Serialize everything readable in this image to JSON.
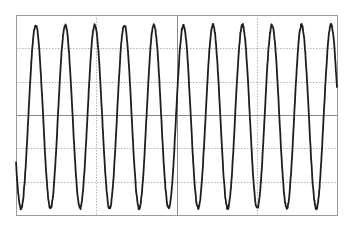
{
  "chart_data": {
    "type": "line",
    "title": "",
    "xlabel": "",
    "ylabel": "",
    "grid": true,
    "legend": null,
    "x_divisions": 4,
    "y_divisions": 6,
    "xlim": [
      0,
      4
    ],
    "ylim": [
      -3,
      3
    ],
    "series": [
      {
        "name": "waveform",
        "shape": "sine",
        "amplitude_div": 2.75,
        "offset_div": -0.05,
        "period_div": 0.368,
        "first_trough_x_div": 0.062,
        "cycles_visible": 10.9,
        "noise": true,
        "color": "#1e1e1e",
        "peaks_x_px": [
          36,
          65,
          95,
          124,
          154,
          185,
          214,
          244,
          273,
          303,
          331
        ],
        "troughs_x_px": [
          21,
          50,
          79,
          109,
          139,
          169,
          199,
          228,
          257,
          286,
          317
        ]
      }
    ]
  },
  "style": {
    "background": "#ffffff",
    "frame_color": "#9a9a9a",
    "axis_color": "#8a8a8a",
    "grid_color": "#b4b4b4",
    "trace_color": "#1e1e1e"
  },
  "frame": {
    "left": 16,
    "top": 15,
    "right": 337,
    "bottom": 215
  }
}
